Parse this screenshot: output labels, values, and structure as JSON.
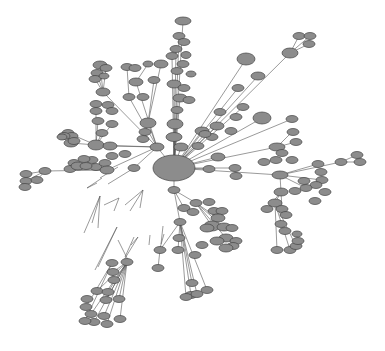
{
  "diagram": {
    "type": "network-graph",
    "background": "#ffffff",
    "node_fill": "#8c8c8c",
    "node_stroke": "#444444",
    "edge_color": "#555555",
    "hub": {
      "x": 174,
      "y": 168,
      "rx": 21,
      "ry": 13
    },
    "nodes": [
      [
        183,
        21,
        8,
        4
      ],
      [
        179,
        36,
        6,
        3.5
      ],
      [
        176,
        49,
        6,
        3.5
      ],
      [
        184,
        42,
        6,
        3.5
      ],
      [
        172,
        56,
        6,
        3.5
      ],
      [
        186,
        55,
        5,
        3.5
      ],
      [
        183,
        64,
        6,
        3.5
      ],
      [
        177,
        71,
        6,
        3.5
      ],
      [
        191,
        74,
        5,
        3
      ],
      [
        174,
        84,
        7,
        4
      ],
      [
        184,
        88,
        6,
        3.5
      ],
      [
        180,
        98,
        7,
        4
      ],
      [
        189,
        100,
        6,
        3.5
      ],
      [
        177,
        110,
        6,
        3.5
      ],
      [
        175,
        124,
        8,
        5
      ],
      [
        174,
        137,
        8,
        4.5
      ],
      [
        181,
        147,
        7,
        4
      ],
      [
        100,
        65,
        7,
        4
      ],
      [
        106,
        68,
        6,
        3.5
      ],
      [
        97,
        73,
        6,
        3.5
      ],
      [
        95,
        79,
        6,
        3.5
      ],
      [
        104,
        76,
        5,
        3
      ],
      [
        127,
        67,
        6,
        3.5
      ],
      [
        135,
        68,
        6,
        3.5
      ],
      [
        148,
        64,
        5,
        3
      ],
      [
        161,
        64,
        7,
        4
      ],
      [
        136,
        82,
        7,
        4
      ],
      [
        154,
        80,
        6,
        3.5
      ],
      [
        129,
        97,
        6,
        3.5
      ],
      [
        143,
        97,
        6,
        3.5
      ],
      [
        103,
        92,
        7,
        4
      ],
      [
        96,
        104,
        6,
        3.5
      ],
      [
        96,
        111,
        6,
        3.5
      ],
      [
        108,
        105,
        6,
        3.5
      ],
      [
        112,
        111,
        6,
        3.5
      ],
      [
        98,
        121,
        6,
        3.5
      ],
      [
        112,
        124,
        6,
        3.5
      ],
      [
        102,
        133,
        6,
        3.5
      ],
      [
        96,
        145,
        8,
        5
      ],
      [
        110,
        146,
        7,
        4
      ],
      [
        112,
        156,
        6,
        3.5
      ],
      [
        125,
        154,
        6,
        3.5
      ],
      [
        92,
        160,
        6,
        3.5
      ],
      [
        96,
        167,
        6,
        3.5
      ],
      [
        105,
        163,
        6,
        3.5
      ],
      [
        148,
        123,
        8,
        5
      ],
      [
        145,
        132,
        6,
        3.5
      ],
      [
        143,
        139,
        6,
        3.5
      ],
      [
        157,
        147,
        7,
        4
      ],
      [
        68,
        133,
        6,
        3.5
      ],
      [
        72,
        136,
        6,
        3.5
      ],
      [
        64,
        136,
        6,
        3.5
      ],
      [
        71,
        143,
        7,
        4
      ],
      [
        74,
        141,
        6,
        3.5
      ],
      [
        62,
        137,
        5,
        3
      ],
      [
        84,
        159,
        6,
        3.5
      ],
      [
        74,
        163,
        6,
        3.5
      ],
      [
        70,
        169,
        6,
        3.5
      ],
      [
        78,
        166,
        7,
        4
      ],
      [
        86,
        166,
        6,
        3.5
      ],
      [
        134,
        168,
        6,
        3.5
      ],
      [
        107,
        170,
        7,
        4
      ],
      [
        45,
        171,
        6,
        3.5
      ],
      [
        26,
        174,
        6,
        3.5
      ],
      [
        26,
        181,
        6,
        3.5
      ],
      [
        25,
        187,
        6,
        3.5
      ],
      [
        37,
        180,
        6,
        3.5
      ],
      [
        299,
        36,
        6,
        3.5
      ],
      [
        310,
        36,
        6,
        3.5
      ],
      [
        309,
        44,
        6,
        3.5
      ],
      [
        290,
        53,
        8,
        5
      ],
      [
        246,
        59,
        9,
        6
      ],
      [
        258,
        76,
        7,
        4
      ],
      [
        238,
        88,
        6,
        3.5
      ],
      [
        243,
        107,
        6,
        3.5
      ],
      [
        262,
        118,
        9,
        6
      ],
      [
        220,
        112,
        6,
        3.5
      ],
      [
        236,
        117,
        6,
        3.5
      ],
      [
        217,
        126,
        7,
        4
      ],
      [
        231,
        131,
        6,
        3.5
      ],
      [
        202,
        131,
        7,
        4
      ],
      [
        212,
        137,
        6,
        3.5
      ],
      [
        198,
        146,
        6,
        3.5
      ],
      [
        205,
        134,
        6,
        3.5
      ],
      [
        292,
        119,
        6,
        3.5
      ],
      [
        293,
        132,
        6,
        3.5
      ],
      [
        296,
        142,
        6,
        3.5
      ],
      [
        277,
        147,
        8,
        4
      ],
      [
        282,
        153,
        6,
        3.5
      ],
      [
        292,
        160,
        6,
        3.5
      ],
      [
        276,
        160,
        6,
        3.5
      ],
      [
        264,
        162,
        6,
        3.5
      ],
      [
        235,
        168,
        6,
        3.5
      ],
      [
        218,
        157,
        7,
        4
      ],
      [
        209,
        169,
        6,
        3.5
      ],
      [
        236,
        176,
        6,
        3.5
      ],
      [
        280,
        175,
        8,
        4
      ],
      [
        318,
        164,
        6,
        3.5
      ],
      [
        321,
        172,
        6,
        3.5
      ],
      [
        322,
        180,
        6,
        3.5
      ],
      [
        316,
        185,
        6,
        3.5
      ],
      [
        306,
        188,
        6,
        3.5
      ],
      [
        304,
        181,
        6,
        3.5
      ],
      [
        295,
        191,
        6,
        3.5
      ],
      [
        325,
        192,
        6,
        3.5
      ],
      [
        315,
        201,
        6,
        3.5
      ],
      [
        341,
        162,
        6,
        3.5
      ],
      [
        357,
        155,
        6,
        3.5
      ],
      [
        360,
        162,
        6,
        3.5
      ],
      [
        281,
        192,
        7,
        4
      ],
      [
        275,
        203,
        7,
        4
      ],
      [
        267,
        209,
        6,
        3.5
      ],
      [
        282,
        209,
        6,
        3.5
      ],
      [
        286,
        215,
        6,
        3.5
      ],
      [
        281,
        224,
        6,
        3.5
      ],
      [
        285,
        231,
        6,
        3.5
      ],
      [
        277,
        250,
        6,
        3.5
      ],
      [
        290,
        250,
        6,
        3.5
      ],
      [
        296,
        246,
        6,
        3.5
      ],
      [
        298,
        241,
        6,
        3.5
      ],
      [
        297,
        234,
        5,
        3
      ],
      [
        174,
        190,
        6,
        3.5
      ],
      [
        184,
        208,
        6,
        3.5
      ],
      [
        196,
        203,
        6,
        3.5
      ],
      [
        193,
        212,
        6,
        3.5
      ],
      [
        209,
        202,
        6,
        3.5
      ],
      [
        214,
        211,
        6,
        3.5
      ],
      [
        222,
        211,
        6,
        3.5
      ],
      [
        218,
        218,
        7,
        4
      ],
      [
        212,
        226,
        8,
        5
      ],
      [
        224,
        227,
        7,
        4
      ],
      [
        207,
        228,
        7,
        4
      ],
      [
        232,
        228,
        6,
        3.5
      ],
      [
        226,
        238,
        7,
        4
      ],
      [
        217,
        241,
        7,
        4
      ],
      [
        236,
        241,
        6,
        3.5
      ],
      [
        233,
        246,
        6,
        3.5
      ],
      [
        226,
        248,
        7,
        4
      ],
      [
        202,
        245,
        6,
        3.5
      ],
      [
        195,
        255,
        6,
        3.5
      ],
      [
        180,
        222,
        6,
        3.5
      ],
      [
        179,
        238,
        6,
        3.5
      ],
      [
        178,
        250,
        6,
        3.5
      ],
      [
        160,
        250,
        6,
        3.5
      ],
      [
        158,
        268,
        6,
        3.5
      ],
      [
        191,
        295,
        6,
        3.5
      ],
      [
        186,
        297,
        6,
        3.5
      ],
      [
        197,
        294,
        6,
        3.5
      ],
      [
        207,
        290,
        6,
        3.5
      ],
      [
        192,
        283,
        6,
        3.5
      ],
      [
        127,
        262,
        6,
        3.5
      ],
      [
        112,
        263,
        6,
        3.5
      ],
      [
        113,
        272,
        6,
        3.5
      ],
      [
        114,
        280,
        6,
        3.5
      ],
      [
        97,
        291,
        6,
        3.5
      ],
      [
        108,
        292,
        6,
        3.5
      ],
      [
        106,
        300,
        6,
        3.5
      ],
      [
        87,
        299,
        6,
        3.5
      ],
      [
        86,
        307,
        6,
        3.5
      ],
      [
        91,
        314,
        6,
        3.5
      ],
      [
        104,
        316,
        6,
        3.5
      ],
      [
        94,
        322,
        6,
        3.5
      ],
      [
        85,
        321,
        6,
        3.5
      ],
      [
        107,
        324,
        6,
        3.5
      ],
      [
        120,
        319,
        6,
        3.5
      ],
      [
        119,
        299,
        6,
        3.5
      ]
    ],
    "edges": [
      [
        174,
        168,
        183,
        21
      ],
      [
        174,
        168,
        179,
        36
      ],
      [
        174,
        168,
        176,
        49
      ],
      [
        174,
        168,
        172,
        56
      ],
      [
        174,
        168,
        174,
        84
      ],
      [
        174,
        168,
        180,
        98
      ],
      [
        174,
        168,
        177,
        110
      ],
      [
        174,
        168,
        175,
        124
      ],
      [
        174,
        168,
        174,
        137
      ],
      [
        174,
        168,
        181,
        147
      ],
      [
        174,
        168,
        246,
        59
      ],
      [
        174,
        168,
        290,
        53
      ],
      [
        290,
        53,
        299,
        36
      ],
      [
        290,
        53,
        310,
        36
      ],
      [
        290,
        53,
        309,
        44
      ],
      [
        174,
        168,
        258,
        76
      ],
      [
        174,
        168,
        238,
        88
      ],
      [
        174,
        168,
        243,
        107
      ],
      [
        174,
        168,
        262,
        118
      ],
      [
        174,
        168,
        217,
        126
      ],
      [
        174,
        168,
        202,
        131
      ],
      [
        174,
        168,
        292,
        119
      ],
      [
        174,
        168,
        277,
        147
      ],
      [
        277,
        147,
        292,
        132
      ],
      [
        277,
        147,
        296,
        142
      ],
      [
        174,
        168,
        235,
        168
      ],
      [
        174,
        168,
        218,
        157
      ],
      [
        174,
        168,
        209,
        169
      ],
      [
        174,
        168,
        280,
        175
      ],
      [
        280,
        175,
        318,
        164
      ],
      [
        280,
        175,
        322,
        180
      ],
      [
        280,
        175,
        306,
        188
      ],
      [
        280,
        175,
        341,
        162
      ],
      [
        341,
        162,
        357,
        155
      ],
      [
        341,
        162,
        360,
        162
      ],
      [
        280,
        175,
        281,
        192
      ],
      [
        281,
        192,
        275,
        203
      ],
      [
        281,
        192,
        267,
        209
      ],
      [
        281,
        192,
        282,
        209
      ],
      [
        275,
        203,
        277,
        250
      ],
      [
        275,
        203,
        290,
        250
      ],
      [
        275,
        203,
        296,
        246
      ],
      [
        174,
        168,
        157,
        147
      ],
      [
        157,
        147,
        148,
        123
      ],
      [
        157,
        147,
        129,
        97
      ],
      [
        157,
        147,
        136,
        82
      ],
      [
        157,
        147,
        103,
        92
      ],
      [
        157,
        147,
        96,
        145
      ],
      [
        157,
        147,
        110,
        146
      ],
      [
        157,
        147,
        107,
        170
      ],
      [
        157,
        147,
        134,
        168
      ],
      [
        129,
        97,
        127,
        67
      ],
      [
        136,
        82,
        148,
        64
      ],
      [
        148,
        123,
        154,
        80
      ],
      [
        148,
        123,
        161,
        64
      ],
      [
        103,
        92,
        100,
        65
      ],
      [
        103,
        92,
        106,
        68
      ],
      [
        103,
        92,
        97,
        73
      ],
      [
        103,
        92,
        95,
        79
      ],
      [
        96,
        145,
        96,
        104
      ],
      [
        96,
        145,
        98,
        121
      ],
      [
        96,
        145,
        112,
        124
      ],
      [
        96,
        145,
        102,
        133
      ],
      [
        96,
        145,
        68,
        133
      ],
      [
        96,
        145,
        71,
        143
      ],
      [
        107,
        170,
        84,
        159
      ],
      [
        107,
        170,
        74,
        163
      ],
      [
        107,
        170,
        70,
        169
      ],
      [
        107,
        170,
        45,
        171
      ],
      [
        45,
        171,
        26,
        174
      ],
      [
        45,
        171,
        26,
        181
      ],
      [
        45,
        171,
        37,
        180
      ],
      [
        174,
        168,
        174,
        190
      ],
      [
        174,
        190,
        184,
        208
      ],
      [
        174,
        190,
        180,
        222
      ],
      [
        174,
        190,
        196,
        203
      ],
      [
        196,
        203,
        212,
        226
      ],
      [
        196,
        203,
        224,
        227
      ],
      [
        196,
        203,
        218,
        218
      ],
      [
        196,
        203,
        226,
        238
      ],
      [
        180,
        222,
        178,
        250
      ],
      [
        180,
        222,
        191,
        295
      ],
      [
        180,
        222,
        186,
        297
      ],
      [
        180,
        222,
        197,
        294
      ],
      [
        180,
        222,
        207,
        290
      ],
      [
        180,
        222,
        192,
        283
      ],
      [
        180,
        222,
        160,
        250
      ],
      [
        160,
        250,
        158,
        268
      ],
      [
        127,
        262,
        113,
        272
      ],
      [
        127,
        262,
        97,
        291
      ],
      [
        127,
        262,
        108,
        292
      ],
      [
        127,
        262,
        106,
        300
      ],
      [
        127,
        262,
        91,
        314
      ],
      [
        127,
        262,
        104,
        316
      ],
      [
        127,
        262,
        94,
        322
      ],
      [
        127,
        262,
        107,
        324
      ],
      [
        127,
        262,
        120,
        319
      ],
      [
        127,
        262,
        119,
        299
      ],
      [
        112,
        263,
        86,
        307
      ],
      [
        112,
        263,
        85,
        321
      ],
      [
        100,
        196,
        92,
        223
      ],
      [
        100,
        196,
        98,
        228
      ],
      [
        100,
        196,
        84,
        233
      ],
      [
        143,
        190,
        140,
        208
      ],
      [
        143,
        190,
        130,
        211
      ],
      [
        143,
        190,
        125,
        205
      ],
      [
        119,
        198,
        104,
        205
      ],
      [
        119,
        198,
        114,
        211
      ],
      [
        117,
        227,
        98,
        267
      ],
      [
        117,
        227,
        95,
        270
      ],
      [
        138,
        237,
        124,
        260
      ],
      [
        138,
        237,
        131,
        245
      ],
      [
        134,
        237,
        125,
        257
      ],
      [
        164,
        234,
        160,
        248
      ],
      [
        163,
        226,
        161,
        244
      ],
      [
        150,
        235,
        149,
        245
      ],
      [
        87,
        188,
        102,
        178
      ],
      [
        87,
        188,
        97,
        183
      ],
      [
        118,
        167,
        100,
        178
      ],
      [
        134,
        168,
        108,
        184
      ],
      [
        128,
        260,
        118,
        240
      ]
    ]
  }
}
